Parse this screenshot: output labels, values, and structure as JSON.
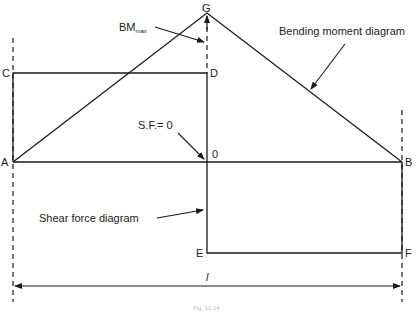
{
  "diagram": {
    "points": {
      "A": "A",
      "B": "B",
      "C": "C",
      "D": "D",
      "E": "E",
      "F": "F",
      "G": "G",
      "O": "0"
    },
    "labels": {
      "bm_max_main": "BM",
      "bm_max_sub": "max",
      "sf_zero": "S.F.= 0",
      "bending_moment": "Bending moment diagram",
      "shear_force": "Shear force diagram",
      "span": "l"
    },
    "caption": "Fig. 10.14",
    "colors": {
      "line": "#1a1a1a",
      "text": "#222222"
    }
  }
}
